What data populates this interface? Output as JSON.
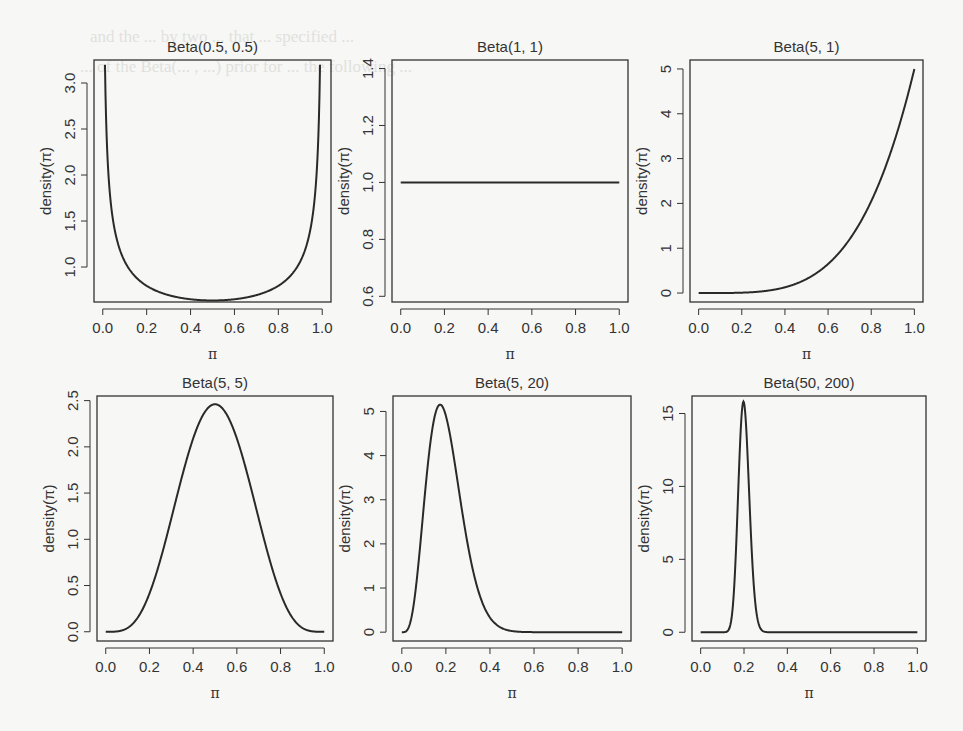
{
  "background_text": [
    "and the ... by two ... that ... specified ...",
    "... of the Beta(... , ...) prior for ... the following ..."
  ],
  "chart_data": [
    {
      "type": "line",
      "title": "Beta(0.5, 0.5)",
      "alpha": 0.5,
      "beta": 0.5,
      "xlabel": "π",
      "ylabel": "density(π)",
      "xlim": [
        0,
        1
      ],
      "ylim": [
        0.62,
        3.25
      ],
      "xticks": [
        0.0,
        0.2,
        0.4,
        0.6,
        0.8,
        1.0
      ],
      "xtick_labels": [
        "0.0",
        "0.2",
        "0.4",
        "0.6",
        "0.8",
        "1.0"
      ],
      "yticks": [
        1.0,
        1.5,
        2.0,
        2.5,
        3.0
      ],
      "ytick_labels": [
        "1.0",
        "1.5",
        "2.0",
        "2.5",
        "3.0"
      ],
      "x": [
        0.01,
        0.05,
        0.1,
        0.2,
        0.3,
        0.4,
        0.5,
        0.6,
        0.7,
        0.8,
        0.9,
        0.95,
        0.99
      ],
      "y": [
        3.2,
        1.46,
        1.06,
        0.8,
        0.69,
        0.65,
        0.64,
        0.65,
        0.69,
        0.8,
        1.06,
        1.46,
        3.2
      ],
      "grid": false,
      "legend": null
    },
    {
      "type": "line",
      "title": "Beta(1, 1)",
      "alpha": 1,
      "beta": 1,
      "xlabel": "π",
      "ylabel": "density(π)",
      "xlim": [
        0,
        1
      ],
      "ylim": [
        0.58,
        1.43
      ],
      "xticks": [
        0.0,
        0.2,
        0.4,
        0.6,
        0.8,
        1.0
      ],
      "xtick_labels": [
        "0.0",
        "0.2",
        "0.4",
        "0.6",
        "0.8",
        "1.0"
      ],
      "yticks": [
        0.6,
        0.8,
        1.0,
        1.2,
        1.4
      ],
      "ytick_labels": [
        "0.6",
        "0.8",
        "1.0",
        "1.2",
        "1.4"
      ],
      "x": [
        0.0,
        0.2,
        0.4,
        0.6,
        0.8,
        1.0
      ],
      "y": [
        1.0,
        1.0,
        1.0,
        1.0,
        1.0,
        1.0
      ],
      "grid": false,
      "legend": null
    },
    {
      "type": "line",
      "title": "Beta(5, 1)",
      "alpha": 5,
      "beta": 1,
      "xlabel": "π",
      "ylabel": "density(π)",
      "xlim": [
        0,
        1
      ],
      "ylim": [
        -0.2,
        5.2
      ],
      "xticks": [
        0.0,
        0.2,
        0.4,
        0.6,
        0.8,
        1.0
      ],
      "xtick_labels": [
        "0.0",
        "0.2",
        "0.4",
        "0.6",
        "0.8",
        "1.0"
      ],
      "yticks": [
        0,
        1,
        2,
        3,
        4,
        5
      ],
      "ytick_labels": [
        "0",
        "1",
        "2",
        "3",
        "4",
        "5"
      ],
      "x": [
        0.0,
        0.2,
        0.4,
        0.5,
        0.6,
        0.7,
        0.8,
        0.9,
        1.0
      ],
      "y": [
        0.0,
        0.008,
        0.128,
        0.3125,
        0.648,
        1.2,
        2.048,
        3.28,
        5.0
      ],
      "grid": false,
      "legend": null
    },
    {
      "type": "line",
      "title": "Beta(5, 5)",
      "alpha": 5,
      "beta": 5,
      "xlabel": "π",
      "ylabel": "density(π)",
      "xlim": [
        0,
        1
      ],
      "ylim": [
        -0.1,
        2.55
      ],
      "xticks": [
        0.0,
        0.2,
        0.4,
        0.6,
        0.8,
        1.0
      ],
      "xtick_labels": [
        "0.0",
        "0.2",
        "0.4",
        "0.6",
        "0.8",
        "1.0"
      ],
      "yticks": [
        0.0,
        0.5,
        1.0,
        1.5,
        2.0,
        2.5
      ],
      "ytick_labels": [
        "0.0",
        "0.5",
        "1.0",
        "1.5",
        "2.0",
        "2.5"
      ],
      "x": [
        0.0,
        0.1,
        0.2,
        0.3,
        0.4,
        0.5,
        0.6,
        0.7,
        0.8,
        0.9,
        1.0
      ],
      "y": [
        0.0,
        0.04,
        0.41,
        1.17,
        2.01,
        2.46,
        2.01,
        1.17,
        0.41,
        0.04,
        0.0
      ],
      "grid": false,
      "legend": null
    },
    {
      "type": "line",
      "title": "Beta(5, 20)",
      "alpha": 5,
      "beta": 20,
      "xlabel": "π",
      "ylabel": "density(π)",
      "xlim": [
        0,
        1
      ],
      "ylim": [
        -0.2,
        5.35
      ],
      "xticks": [
        0.0,
        0.2,
        0.4,
        0.6,
        0.8,
        1.0
      ],
      "xtick_labels": [
        "0.0",
        "0.2",
        "0.4",
        "0.6",
        "0.8",
        "1.0"
      ],
      "yticks": [
        0,
        1,
        2,
        3,
        4,
        5
      ],
      "ytick_labels": [
        "0",
        "1",
        "2",
        "3",
        "4",
        "5"
      ],
      "x": [
        0.0,
        0.05,
        0.1,
        0.15,
        0.167,
        0.2,
        0.25,
        0.3,
        0.4,
        0.5,
        0.6,
        1.0
      ],
      "y": [
        0.0,
        0.7,
        3.23,
        5.06,
        5.15,
        4.87,
        3.55,
        1.92,
        0.34,
        0.03,
        0.0,
        0.0
      ],
      "grid": false,
      "legend": null
    },
    {
      "type": "line",
      "title": "Beta(50, 200)",
      "alpha": 50,
      "beta": 200,
      "xlabel": "π",
      "ylabel": "density(π)",
      "xlim": [
        0,
        1
      ],
      "ylim": [
        -0.6,
        16.2
      ],
      "xticks": [
        0.0,
        0.2,
        0.4,
        0.6,
        0.8,
        1.0
      ],
      "xtick_labels": [
        "0.0",
        "0.2",
        "0.4",
        "0.6",
        "0.8",
        "1.0"
      ],
      "yticks": [
        0,
        5,
        10,
        15
      ],
      "ytick_labels": [
        "0",
        "5",
        "10",
        "15"
      ],
      "x": [
        0.0,
        0.12,
        0.15,
        0.17,
        0.197,
        0.22,
        0.25,
        0.28,
        0.3,
        1.0
      ],
      "y": [
        0.0,
        0.3,
        4.2,
        10.4,
        15.8,
        11.5,
        3.6,
        0.4,
        0.05,
        0.0
      ],
      "grid": false,
      "legend": null
    }
  ],
  "panels_layout": [
    {
      "box": [
        94,
        60,
        331,
        302
      ]
    },
    {
      "box": [
        392,
        60,
        628,
        302
      ]
    },
    {
      "box": [
        690,
        60,
        923,
        302
      ]
    },
    {
      "box": [
        97,
        396,
        333,
        641
      ]
    },
    {
      "box": [
        393,
        396,
        631,
        641
      ]
    },
    {
      "box": [
        692,
        396,
        926,
        641
      ]
    }
  ],
  "colors": {
    "line": "#2a2a2a",
    "axis": "#333333",
    "text": "#333333",
    "background": "#f7f7f5"
  }
}
